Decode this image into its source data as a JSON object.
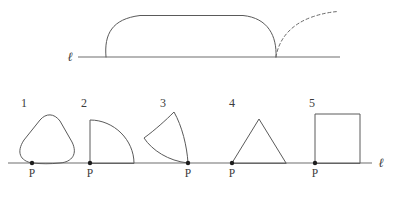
{
  "figure": {
    "stroke_color": "#5a5a5a",
    "line_color": "#6e6e6e",
    "dot_color": "#1d1d1d",
    "background_color": "#ffffff"
  },
  "top_panel": {
    "line_label": "ℓ",
    "line_label_x": 70,
    "line_label_y": 61,
    "line": {
      "x1": 78,
      "y1": 57,
      "x2": 340,
      "y2": 57
    },
    "solid_shape": {
      "name": "rolling-dome-shape",
      "path": "M 106 57 C 104 34 112 19 140 15.5 L 243 15.5 C 268 18 277 36 276 57",
      "description": "flattened dome / stadium arch standing on line"
    },
    "dashed_shape": {
      "name": "tipping-trajectory",
      "path": "M 276 57 C 279 38 292 24 312 17 C 322 13.5 331 12 338 11.5",
      "description": "dashed arc showing the path as the shape tips over"
    }
  },
  "bottom_panel": {
    "line_label": "ℓ",
    "line_label_x": 381,
    "line_label_y": 167,
    "line": {
      "x1": 8,
      "y1": 163,
      "x2": 372,
      "y2": 163
    },
    "point_label": "P",
    "shapes": [
      {
        "index": "1",
        "name": "rounded-triangle",
        "index_x": 24,
        "index_y": 107,
        "dot_x": 32,
        "dot_y": 163,
        "label_x": 32,
        "label_y": 177,
        "path": "M 32 163 C 20 161 16 152 24 140 L 40 120 C 46 113 54 113 60 121 L 72 142 C 78 154 72 162 60 163 C 50 164 42 164 32 163 Z"
      },
      {
        "index": "2",
        "name": "quarter-circle",
        "index_x": 84,
        "index_y": 107,
        "dot_x": 90,
        "dot_y": 163,
        "label_x": 90,
        "label_y": 177,
        "path": "M 90 163 L 90 120 C 114 120 134 140 134 163 Z"
      },
      {
        "index": "3",
        "name": "concave-curved-triangle",
        "index_x": 163,
        "index_y": 107,
        "dot_x": 188,
        "dot_y": 163,
        "label_x": 188,
        "label_y": 177,
        "path": "M 188 163 C 168 161 152 150 144 138 C 155 130 166 120 174 112 C 182 126 187 146 188 163 Z"
      },
      {
        "index": "4",
        "name": "triangle",
        "index_x": 232,
        "index_y": 107,
        "dot_x": 232,
        "dot_y": 163,
        "label_x": 232,
        "label_y": 177,
        "path": "M 232 163 L 259 119 L 286 163 Z"
      },
      {
        "index": "5",
        "name": "square",
        "index_x": 312,
        "index_y": 107,
        "dot_x": 315,
        "dot_y": 163,
        "label_x": 315,
        "label_y": 177,
        "path": "M 315 163 L 315 114 L 360 114 L 360 163 Z"
      }
    ]
  }
}
